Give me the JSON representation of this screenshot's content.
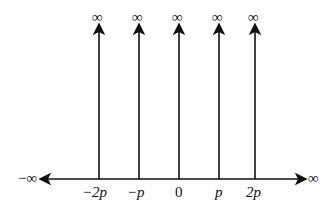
{
  "diagram": {
    "type": "impulse-train",
    "axis": {
      "left_label": "−∞",
      "right_label": "∞"
    },
    "spikes": [
      {
        "x_label": "−2p",
        "top_label": "∞",
        "x": 99
      },
      {
        "x_label": "−p",
        "top_label": "∞",
        "x": 139
      },
      {
        "x_label": "0",
        "top_label": "∞",
        "x": 179
      },
      {
        "x_label": "p",
        "top_label": "∞",
        "x": 219
      },
      {
        "x_label": "2p",
        "top_label": "∞",
        "x": 255
      }
    ]
  }
}
